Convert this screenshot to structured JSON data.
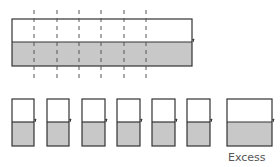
{
  "diagram": {
    "title": "",
    "top_bar": {
      "x": 12,
      "y": 19,
      "w": 180,
      "h": 47,
      "split_y": 42
    },
    "cut_lines_x": [
      34,
      57,
      79,
      101,
      124,
      146
    ],
    "pieces": [
      {
        "x": 12,
        "w": 22
      },
      {
        "x": 47,
        "w": 22
      },
      {
        "x": 82,
        "w": 23
      },
      {
        "x": 117,
        "w": 23
      },
      {
        "x": 152,
        "w": 23
      },
      {
        "x": 187,
        "w": 23
      }
    ],
    "excess_piece": {
      "x": 227,
      "w": 45
    },
    "pieces_y": 99,
    "pieces_h": 47,
    "pieces_split_y": 122,
    "excess_label": "Excess",
    "colors": {
      "outline": "#333333",
      "fill_bottom": "#c8c8c8",
      "fill_top": "#ffffff",
      "dash": "#555555"
    }
  }
}
